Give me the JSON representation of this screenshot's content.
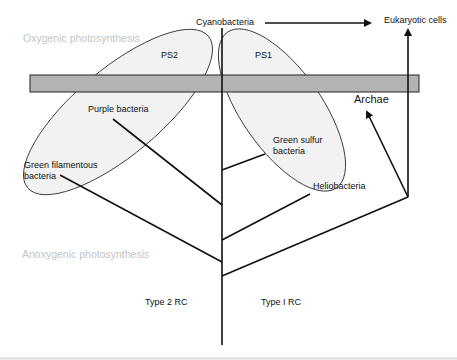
{
  "diagram": {
    "title_regions": {
      "oxygenic": "Oxygenic photosynthesis",
      "anoxygenic": "Anoxygenic photosynthesis"
    },
    "photosystems": {
      "ps2": "PS2",
      "ps1": "PS1"
    },
    "taxa": {
      "cyanobacteria": "Cyanobacteria",
      "eukaryotic_cells": "Eukaryotic cells",
      "archae": "Archae",
      "purple_bacteria": "Purple bacteria",
      "green_filamentous_line1": "Green filamentous",
      "green_filamentous_line2": "bacteria",
      "green_sulfur_line1": "Green sulfur",
      "green_sulfur_line2": "bacteria",
      "heliobacteria": "Heliobacteria"
    },
    "reaction_centers": {
      "type2": "Type 2 RC",
      "type1": "Type I RC"
    },
    "colors": {
      "ellipse_fill": "#f2f2f2",
      "bar_fill": "#b3b3b3",
      "line": "#111111",
      "faint_text": "#c4c4c4"
    }
  }
}
